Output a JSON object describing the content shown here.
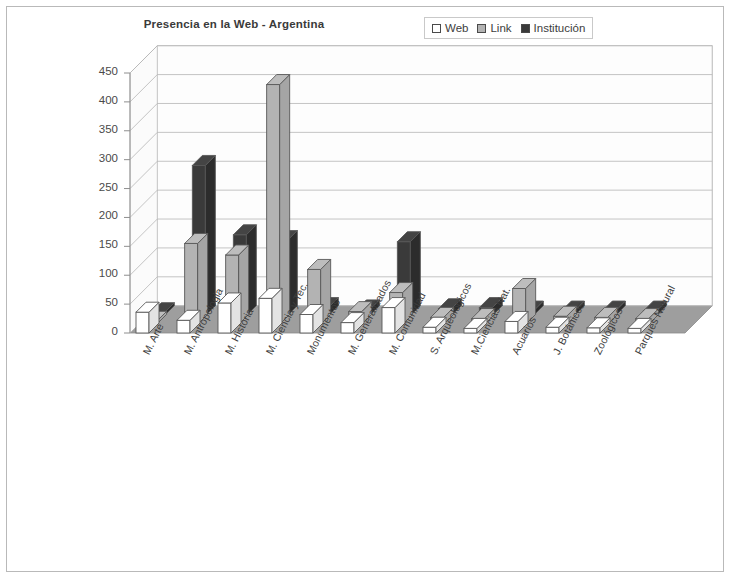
{
  "chart_data": {
    "type": "bar",
    "title": "Presencia en la Web - Argentina",
    "xlabel": "",
    "ylabel": "",
    "ylim": [
      0,
      450
    ],
    "yticks": [
      0,
      50,
      100,
      150,
      200,
      250,
      300,
      350,
      400,
      450
    ],
    "grid": true,
    "legend_position": "top-right",
    "projection": "3d-columns",
    "categories": [
      "M. Arte",
      "M. Antropologia",
      "M. Historia",
      "M. Ciencia y Tec.",
      "Monumentos",
      "M. Generalizados",
      "M. Comunidad",
      "S. Arqueologicos",
      "M.Ciencias Nat.",
      "Acuarios",
      "J. Botanicos",
      "Zoologicos",
      "Parques Natural"
    ],
    "series": [
      {
        "name": "Web",
        "color": "#ffffff",
        "values": [
          36,
          22,
          52,
          60,
          32,
          18,
          44,
          10,
          8,
          20,
          10,
          9,
          8
        ]
      },
      {
        "name": "Link",
        "color": "#b3b3b3",
        "values": [
          0,
          140,
          120,
          415,
          95,
          22,
          55,
          12,
          10,
          62,
          14,
          12,
          10
        ]
      },
      {
        "name": "Institucion",
        "color": "#3a3a3a",
        "values": [
          0,
          260,
          140,
          130,
          14,
          10,
          128,
          12,
          14,
          8,
          8,
          8,
          8
        ]
      }
    ]
  },
  "legend": {
    "items": [
      {
        "label": "Web",
        "swatch": "white-square-icon"
      },
      {
        "label": "Link",
        "swatch": "gray-square-icon"
      },
      {
        "label": "Institución",
        "swatch": "black-square-icon"
      }
    ]
  },
  "axis": {
    "y_ticks": [
      "450",
      "400",
      "350",
      "300",
      "250",
      "200",
      "150",
      "100",
      "50",
      "0"
    ]
  },
  "categories_display": [
    "M. Arte",
    "M. Antropologia",
    "M. Historia",
    "M. Ciencia y Tec.",
    "Monumentos",
    "M. Generalizados",
    "M. Comunidad",
    "S. Arqueologicos",
    "M.Ciencias Nat.",
    "Acuarios",
    "J. Botánicos",
    "Zoológicos",
    "Parques Natural"
  ],
  "colors": {
    "web": "#ffffff",
    "link": "#b3b3b3",
    "institucion": "#3a3a3a",
    "floor": "#9e9e9e",
    "wall": "#fdfdfd",
    "outline": "#585858",
    "grid": "#b5b5b5",
    "frame": "#b9b9b9"
  }
}
